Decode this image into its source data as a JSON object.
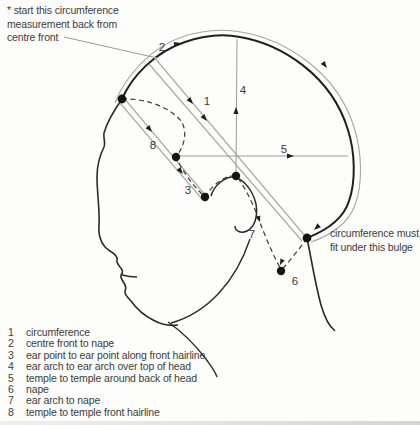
{
  "diagram": {
    "start_note": {
      "line1": "* start this circumference",
      "line2": "measurement back from",
      "line3": "centre front"
    },
    "bulge_note": {
      "line1": "circumference must",
      "line2": "fit under this bulge"
    },
    "markers": {
      "m1": "1",
      "m2": "2",
      "m3": "3",
      "m4": "4",
      "m5": "5",
      "m6": "6",
      "m7": "7",
      "m8": "8"
    },
    "colors": {
      "ink": "#1f1f1f",
      "measure_line": "#a6a6a6",
      "dashed_line": "#3c3c3c",
      "text": "#3c3c3c"
    }
  },
  "legend": {
    "items": [
      {
        "num": "1",
        "label": "circumference"
      },
      {
        "num": "2",
        "label": "centre front to nape"
      },
      {
        "num": "3",
        "label": "ear point to ear point along front hairline"
      },
      {
        "num": "4",
        "label": "ear arch to ear arch over top of head"
      },
      {
        "num": "5",
        "label": "temple to temple around back of head"
      },
      {
        "num": "6",
        "label": "nape"
      },
      {
        "num": "7",
        "label": "ear arch to nape"
      },
      {
        "num": "8",
        "label": "temple to temple front hairline"
      }
    ]
  }
}
